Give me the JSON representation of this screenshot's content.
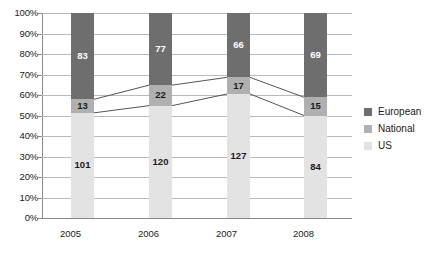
{
  "chart_data": {
    "type": "bar",
    "subtype": "stacked-column-100-percent",
    "title": "",
    "subtitle": "",
    "xlabel": "",
    "ylabel": "",
    "categories": [
      "2005",
      "2006",
      "2007",
      "2008"
    ],
    "series": [
      {
        "name": "US",
        "color": "#e3e3e3",
        "values": [
          101,
          120,
          127,
          84
        ]
      },
      {
        "name": "National",
        "color": "#b0b0b0",
        "values": [
          13,
          22,
          17,
          15
        ]
      },
      {
        "name": "European",
        "color": "#6e6e6e",
        "values": [
          83,
          77,
          66,
          69
        ]
      }
    ],
    "stack_order_bottom_to_top": [
      "US",
      "National",
      "European"
    ],
    "totals": [
      197,
      219,
      210,
      168
    ],
    "percentages": {
      "US": [
        51.3,
        54.8,
        60.5,
        50.0
      ],
      "National": [
        6.6,
        10.0,
        8.1,
        8.9
      ],
      "European": [
        42.1,
        35.2,
        31.4,
        41.1
      ]
    },
    "cumulative_boundaries_percent": {
      "us_top": [
        51.3,
        54.8,
        60.5,
        50.0
      ],
      "national_top": [
        57.9,
        64.8,
        68.6,
        58.9
      ]
    },
    "ylim": [
      0,
      100
    ],
    "yticks": [
      "0%",
      "10%",
      "20%",
      "30%",
      "40%",
      "50%",
      "60%",
      "70%",
      "80%",
      "90%",
      "100%"
    ],
    "ytick_values": [
      0,
      10,
      20,
      30,
      40,
      50,
      60,
      70,
      80,
      90,
      100
    ],
    "grid": true,
    "grid_axis": "y",
    "legend_position": "right",
    "connector_lines": true,
    "connector_line_color": "#555555",
    "data_labels": "absolute-values"
  },
  "axes": {
    "y_tick_labels": [
      "100%",
      "90%",
      "80%",
      "70%",
      "60%",
      "50%",
      "40%",
      "30%",
      "20%",
      "10%",
      "0%"
    ],
    "x_tick_labels": [
      "2005",
      "2006",
      "2007",
      "2008"
    ]
  },
  "bars": [
    {
      "category": "2005",
      "segments": [
        {
          "series": "European",
          "label": "83",
          "percent": 42.1,
          "bottom_percent": 57.9
        },
        {
          "series": "National",
          "label": "13",
          "percent": 6.6,
          "bottom_percent": 51.3
        },
        {
          "series": "US",
          "label": "101",
          "percent": 51.3,
          "bottom_percent": 0
        }
      ]
    },
    {
      "category": "2006",
      "segments": [
        {
          "series": "European",
          "label": "77",
          "percent": 35.2,
          "bottom_percent": 64.8
        },
        {
          "series": "National",
          "label": "22",
          "percent": 10.0,
          "bottom_percent": 54.8
        },
        {
          "series": "US",
          "label": "120",
          "percent": 54.8,
          "bottom_percent": 0
        }
      ]
    },
    {
      "category": "2007",
      "segments": [
        {
          "series": "European",
          "label": "66",
          "percent": 31.4,
          "bottom_percent": 68.6
        },
        {
          "series": "National",
          "label": "17",
          "percent": 8.1,
          "bottom_percent": 60.5
        },
        {
          "series": "US",
          "label": "127",
          "percent": 60.5,
          "bottom_percent": 0
        }
      ]
    },
    {
      "category": "2008",
      "segments": [
        {
          "series": "European",
          "label": "69",
          "percent": 41.1,
          "bottom_percent": 58.9
        },
        {
          "series": "National",
          "label": "15",
          "percent": 8.9,
          "bottom_percent": 50.0
        },
        {
          "series": "US",
          "label": "84",
          "percent": 50.0,
          "bottom_percent": 0
        }
      ]
    }
  ],
  "legend": {
    "items": [
      {
        "label": "European",
        "color": "#6e6e6e"
      },
      {
        "label": "National",
        "color": "#b0b0b0"
      },
      {
        "label": "US",
        "color": "#e3e3e3"
      }
    ]
  },
  "colors": {
    "european": "#6e6e6e",
    "national": "#b0b0b0",
    "us": "#e3e3e3",
    "gridline": "#b9b9b9",
    "axis": "#8a8a8a",
    "connector": "#555555",
    "text": "#1a1a1a",
    "background": "#ffffff"
  }
}
